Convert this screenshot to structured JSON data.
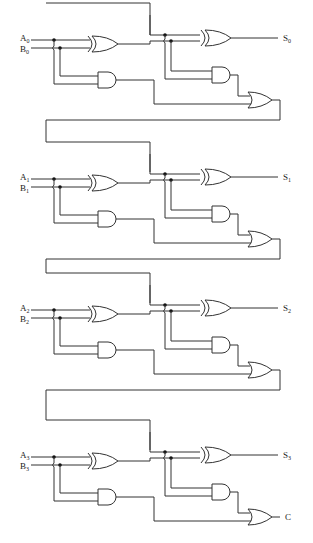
{
  "diagram": {
    "colors": {
      "line": "#333333",
      "background": "#ffffff",
      "dot": "#111111"
    },
    "stages": [
      {
        "a_label": "A",
        "a_sub": "0",
        "b_label": "B",
        "b_sub": "0",
        "sum_label": "S",
        "sum_sub": "0",
        "y": 40
      },
      {
        "a_label": "A",
        "a_sub": "1",
        "b_label": "B",
        "b_sub": "1",
        "sum_label": "S",
        "sum_sub": "1",
        "y": 179
      },
      {
        "a_label": "A",
        "a_sub": "2",
        "b_label": "B",
        "b_sub": "2",
        "sum_label": "S",
        "sum_sub": "2",
        "y": 310
      },
      {
        "a_label": "A",
        "a_sub": "3",
        "b_label": "B",
        "b_sub": "3",
        "sum_label": "S",
        "sum_sub": "3",
        "y": 457
      }
    ],
    "carry_out_label": "C",
    "gate_types": [
      "xor-gate",
      "and-gate",
      "or-gate"
    ]
  }
}
